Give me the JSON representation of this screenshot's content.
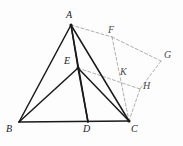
{
  "figure": {
    "type": "geometry-diagram",
    "width": 183,
    "height": 146,
    "background_color": "#fdfdfd",
    "solid_stroke_color": "#1a1a1a",
    "dashed_stroke_color": "#9a9a9a",
    "label_color": "#1a1a1a"
  },
  "labels": {
    "A": "A",
    "B": "B",
    "C": "C",
    "D": "D",
    "E": "E",
    "F": "F",
    "G": "G",
    "H": "H",
    "K": "K"
  },
  "points": {
    "A": {
      "name": "A",
      "x": 71,
      "y": 25
    },
    "B": {
      "name": "B",
      "x": 19,
      "y": 122
    },
    "C": {
      "name": "C",
      "x": 129,
      "y": 121
    },
    "D": {
      "name": "D",
      "x": 88,
      "y": 122
    },
    "E": {
      "name": "E",
      "x": 78,
      "y": 68
    },
    "F": {
      "name": "F",
      "x": 112,
      "y": 37
    },
    "G": {
      "name": "G",
      "x": 161,
      "y": 61
    },
    "H": {
      "name": "H",
      "x": 140,
      "y": 89
    },
    "K": {
      "name": "K",
      "x": 120,
      "y": 78
    }
  },
  "label_positions": {
    "A": {
      "x": 66,
      "y": 10
    },
    "B": {
      "x": 6,
      "y": 124
    },
    "C": {
      "x": 131,
      "y": 124
    },
    "D": {
      "x": 83,
      "y": 124
    },
    "E": {
      "x": 64,
      "y": 56
    },
    "F": {
      "x": 108,
      "y": 25
    },
    "G": {
      "x": 164,
      "y": 50
    },
    "H": {
      "x": 143,
      "y": 81
    },
    "K": {
      "x": 120,
      "y": 67
    }
  },
  "segments": {
    "solid": [
      {
        "name": "segment-AB",
        "from": "A",
        "to": "B"
      },
      {
        "name": "segment-AE",
        "from": "A",
        "to": "E"
      },
      {
        "name": "segment-AD",
        "from": "A",
        "to": "D"
      },
      {
        "name": "segment-AC",
        "from": "A",
        "to": "C"
      },
      {
        "name": "segment-BC",
        "from": "B",
        "to": "C"
      },
      {
        "name": "segment-BE",
        "from": "B",
        "to": "E"
      },
      {
        "name": "segment-ED",
        "from": "E",
        "to": "D"
      },
      {
        "name": "segment-EC",
        "from": "E",
        "to": "C"
      }
    ],
    "dashed": [
      {
        "name": "segment-AF",
        "from": "A",
        "to": "F"
      },
      {
        "name": "segment-FG",
        "from": "F",
        "to": "G"
      },
      {
        "name": "segment-FC",
        "from": "F",
        "to": "C"
      },
      {
        "name": "segment-EH",
        "from": "E",
        "to": "H"
      },
      {
        "name": "segment-GH",
        "from": "G",
        "to": "H"
      },
      {
        "name": "segment-HC",
        "from": "H",
        "to": "C"
      }
    ]
  },
  "vertex_dots": [
    "A",
    "E",
    "C"
  ]
}
